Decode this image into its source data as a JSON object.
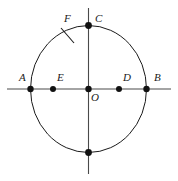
{
  "figure": {
    "type": "geometry-diagram",
    "colors": {
      "background": "#ffffff",
      "stroke": "#1a1a1a",
      "axis": "#4a4a4a",
      "point_fill": "#111111",
      "label": "#1a1a1a"
    },
    "circle": {
      "center_x": 88.5,
      "center_y": 89,
      "radius_x": 58,
      "radius_y": 63.5,
      "stroke_width": 1
    },
    "horizontal_axis": {
      "x1": 7,
      "y1": 89,
      "x2": 171,
      "y2": 89
    },
    "vertical_axis": {
      "x1": 88.5,
      "y1": 8,
      "x2": 88.5,
      "y2": 174
    },
    "tick_mark": {
      "x1": 61,
      "y1": 28,
      "x2": 74,
      "y2": 43
    },
    "points": [
      {
        "id": "A",
        "label": "A",
        "x": 30.5,
        "y": 89,
        "label_x": 19,
        "label_y": 72,
        "radius": 3.2,
        "labeled": true
      },
      {
        "id": "E",
        "label": "E",
        "x": 53,
        "y": 89,
        "label_x": 57,
        "label_y": 72,
        "radius": 3.0,
        "labeled": true
      },
      {
        "id": "O",
        "label": "O",
        "x": 88.5,
        "y": 89,
        "label_x": 91,
        "label_y": 92,
        "radius": 3.2,
        "labeled": true
      },
      {
        "id": "D",
        "label": "D",
        "x": 119,
        "y": 89,
        "label_x": 123,
        "label_y": 72,
        "radius": 3.0,
        "labeled": true
      },
      {
        "id": "B",
        "label": "B",
        "x": 146.5,
        "y": 89,
        "label_x": 154,
        "label_y": 72,
        "radius": 3.2,
        "labeled": true
      },
      {
        "id": "C",
        "label": "C",
        "x": 88.5,
        "y": 25.5,
        "label_x": 95,
        "label_y": 13,
        "radius": 3.4,
        "labeled": true
      },
      {
        "id": "S",
        "label": "",
        "x": 88.5,
        "y": 152.5,
        "label_x": 0,
        "label_y": 0,
        "radius": 3.4,
        "labeled": false
      }
    ],
    "free_labels": [
      {
        "id": "F",
        "label": "F",
        "x": 64,
        "y": 13
      }
    ]
  }
}
